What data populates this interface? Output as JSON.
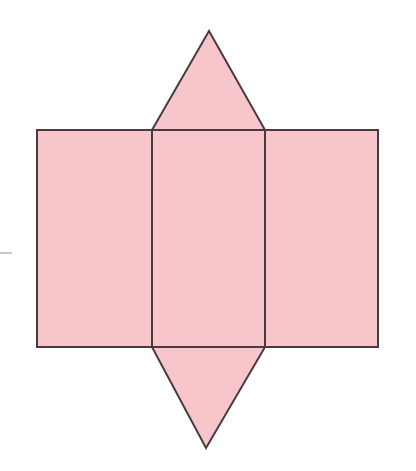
{
  "figure": {
    "canvas": {
      "width": 416,
      "height": 471,
      "background": "#ffffff"
    },
    "style": {
      "fill_color": "#f7c6ca",
      "stroke_color": "#4a3a42",
      "stroke_width": 2.0,
      "tick_color": "#9a8d93"
    },
    "faces": [
      {
        "id": "left-rectangle",
        "name": "left rectangular face",
        "shape": "rectangle",
        "points": "37,130 152,130 152,347 37,347"
      },
      {
        "id": "middle-rectangle",
        "name": "middle rectangular face",
        "shape": "rectangle",
        "points": "152,130 265,130 265,347 152,347"
      },
      {
        "id": "right-rectangle",
        "name": "right rectangular face",
        "shape": "rectangle",
        "points": "265,130 378,130 378,347 265,347"
      },
      {
        "id": "top-triangle",
        "name": "top triangular face",
        "shape": "triangle",
        "points": "152,130 209,31 265,130"
      },
      {
        "id": "bottom-triangle",
        "name": "bottom triangular face",
        "shape": "triangle",
        "points": "152,347 265,347 206,448"
      }
    ],
    "fold_lines": [
      {
        "id": "fold-left",
        "name": "left fold line",
        "x1": 152,
        "y1": 130,
        "x2": 152,
        "y2": 347
      },
      {
        "id": "fold-right",
        "name": "right fold line",
        "x1": 265,
        "y1": 130,
        "x2": 265,
        "y2": 347
      },
      {
        "id": "fold-top",
        "name": "top fold line",
        "x1": 152,
        "y1": 130,
        "x2": 265,
        "y2": 130
      },
      {
        "id": "fold-bottom",
        "name": "bottom fold line",
        "x1": 152,
        "y1": 347,
        "x2": 265,
        "y2": 347
      }
    ],
    "margin_marks": [
      {
        "id": "left-edge-tick",
        "name": "left margin tick",
        "x": 0,
        "y": 252,
        "width": 12,
        "height": 2
      }
    ]
  }
}
